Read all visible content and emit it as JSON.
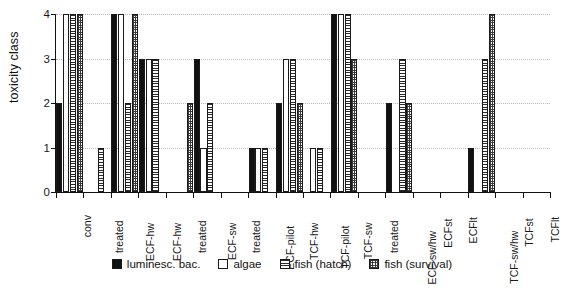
{
  "chart_data": {
    "type": "bar",
    "title": "",
    "xlabel": "",
    "ylabel": "toxicity class",
    "ylim": [
      0,
      4
    ],
    "yticks": [
      0,
      1,
      2,
      3,
      4
    ],
    "grid": true,
    "legend_position": "bottom",
    "categories": [
      "conv",
      "treated",
      "ECF-hw",
      "ECF-hw",
      "treated",
      "ECF-sw",
      "treated",
      "ECF-pilot",
      "TCF-hw",
      "TCF-pilot",
      "TCF-sw",
      "treated",
      "ECF-sw/hw",
      "ECFst",
      "ECFlt",
      "TCF-sw/hw",
      "TCFst",
      "TCFlt"
    ],
    "series": [
      {
        "name": "luminesc. bac.",
        "values": [
          2,
          0,
          4,
          3,
          0,
          3,
          0,
          1,
          2,
          0,
          4,
          0,
          2,
          0,
          0,
          1,
          0,
          0
        ]
      },
      {
        "name": "algae",
        "values": [
          4,
          0,
          4,
          3,
          0,
          1,
          0,
          1,
          3,
          1,
          4,
          0,
          0,
          0,
          0,
          0,
          0,
          0
        ]
      },
      {
        "name": "fish (hatch)",
        "values": [
          4,
          1,
          2,
          3,
          0,
          2,
          0,
          1,
          3,
          1,
          4,
          0,
          3,
          0,
          0,
          3,
          0,
          0
        ]
      },
      {
        "name": "fish (survival)",
        "values": [
          4,
          0,
          4,
          0,
          2,
          0,
          0,
          0,
          2,
          0,
          3,
          0,
          2,
          0,
          0,
          4,
          0,
          0
        ]
      }
    ]
  },
  "legend": {
    "items": [
      {
        "label": "luminesc. bac.",
        "swatch": "solid-black-swatch"
      },
      {
        "label": "algae",
        "swatch": "white-swatch"
      },
      {
        "label": "fish (hatch)",
        "swatch": "horizontal-hatch-swatch"
      },
      {
        "label": "fish (survival)",
        "swatch": "crosshatch-swatch"
      }
    ]
  }
}
